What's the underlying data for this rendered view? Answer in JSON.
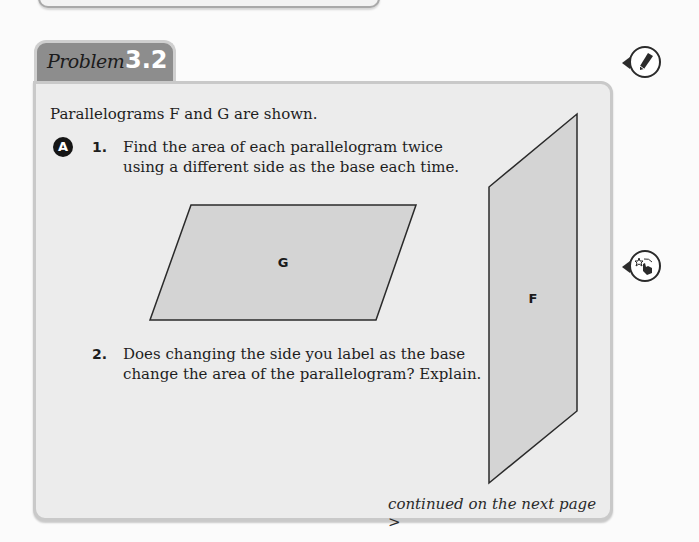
{
  "problem": {
    "tab_word": "Problem",
    "tab_number": "3.2",
    "intro": "Parallelograms F and G are shown.",
    "part_badge": "A",
    "questions": [
      {
        "number": "1.",
        "text": "Find the area of each parallelogram twice using a different side as the base each time."
      },
      {
        "number": "2.",
        "text": "Does changing the side you label as the base change the area of the parallelogram? Explain."
      }
    ],
    "shapes": [
      {
        "label": "G",
        "points": "191,205 416,205 376,320 150,320"
      },
      {
        "label": "F",
        "points": "489,187 577,114 577,411 489,483"
      }
    ],
    "continued": "continued on the next page >"
  },
  "side_icons": [
    {
      "name": "pencil-icon"
    },
    {
      "name": "hand-star-icon"
    }
  ],
  "colors": {
    "tab_bg": "#8d8d8d",
    "box_bg": "#ececec",
    "shape_fill": "#d4d4d4"
  }
}
